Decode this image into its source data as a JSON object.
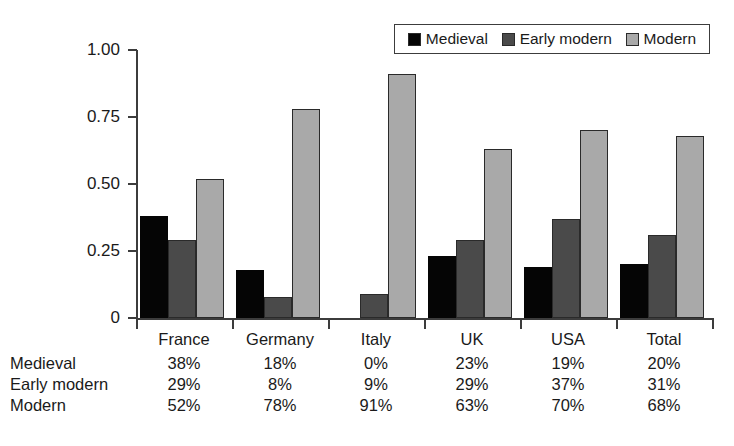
{
  "chart_data": {
    "type": "bar",
    "title": "",
    "xlabel": "",
    "ylabel": "",
    "ylim": [
      0,
      1.0
    ],
    "ytick_labels": [
      "0",
      "0.25",
      "0.50",
      "0.75",
      "1.00"
    ],
    "ytick_values": [
      0,
      0.25,
      0.5,
      0.75,
      1.0
    ],
    "grid": false,
    "legend_position": "top-right",
    "categories": [
      "France",
      "Germany",
      "Italy",
      "UK",
      "USA",
      "Total"
    ],
    "series": [
      {
        "name": "Medieval",
        "color": "#050505",
        "values": [
          0.38,
          0.18,
          0.0,
          0.23,
          0.19,
          0.2
        ],
        "labels": [
          "38%",
          "18%",
          "0%",
          "23%",
          "19%",
          "20%"
        ]
      },
      {
        "name": "Early modern",
        "color": "#4a4a4a",
        "values": [
          0.29,
          0.08,
          0.09,
          0.29,
          0.37,
          0.31
        ],
        "labels": [
          "29%",
          "8%",
          "9%",
          "29%",
          "37%",
          "31%"
        ]
      },
      {
        "name": "Modern",
        "color": "#a9a9a9",
        "values": [
          0.52,
          0.78,
          0.91,
          0.63,
          0.7,
          0.68
        ],
        "labels": [
          "52%",
          "78%",
          "91%",
          "63%",
          "70%",
          "68%"
        ]
      }
    ]
  },
  "legend": {
    "items": [
      {
        "label": "Medieval",
        "color": "#050505"
      },
      {
        "label": "Early modern",
        "color": "#4a4a4a"
      },
      {
        "label": "Modern",
        "color": "#a9a9a9"
      }
    ]
  },
  "table": {
    "column_headers": [
      "France",
      "Germany",
      "Italy",
      "UK",
      "USA",
      "Total"
    ],
    "rows": [
      {
        "label": "Medieval",
        "cells": [
          "38%",
          "18%",
          "0%",
          "23%",
          "19%",
          "20%"
        ]
      },
      {
        "label": "Early modern",
        "cells": [
          "29%",
          "8%",
          "9%",
          "29%",
          "37%",
          "31%"
        ]
      },
      {
        "label": "Modern",
        "cells": [
          "52%",
          "78%",
          "91%",
          "63%",
          "70%",
          "68%"
        ]
      }
    ]
  }
}
